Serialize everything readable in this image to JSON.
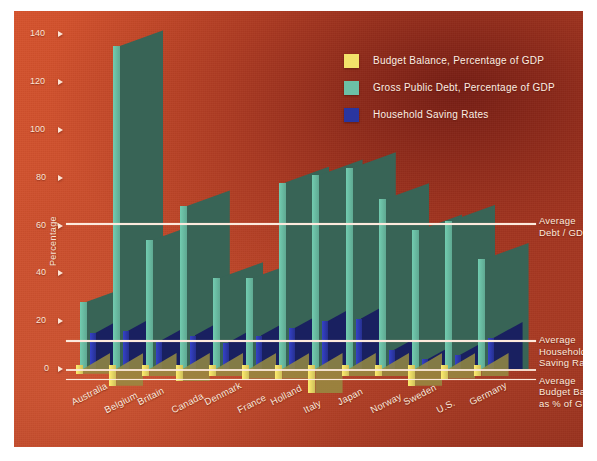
{
  "chart_data": {
    "type": "bar",
    "title": "",
    "subtitle": "",
    "xlabel": "",
    "ylabel": "Percentage",
    "ylim": [
      -10,
      140
    ],
    "yticks": [
      0,
      20,
      40,
      60,
      80,
      100,
      120,
      140
    ],
    "grid": false,
    "legend_position": "top-right",
    "categories": [
      "Australia",
      "Belgium",
      "Britain",
      "Canada",
      "Denmark",
      "France",
      "Holland",
      "Italy",
      "Japan",
      "Norway",
      "Sweden",
      "U.S.",
      "Germany"
    ],
    "series": [
      {
        "name": "Budget Balance, Percentage of GDP",
        "color": "#f2e26a",
        "values": [
          -2,
          -7,
          -3,
          -5,
          -3,
          -4,
          -4,
          -10,
          -3,
          -3,
          -7,
          -4,
          -3
        ]
      },
      {
        "name": "Gross Public Debt, Percentage of GDP",
        "color": "#6cc0a6",
        "values": [
          28,
          135,
          54,
          68,
          38,
          38,
          78,
          81,
          84,
          71,
          58,
          62,
          46
        ]
      },
      {
        "name": "Household Saving Rates",
        "color": "#2a35a0",
        "values": [
          15,
          16,
          12,
          14,
          11,
          14,
          17,
          20,
          21,
          8,
          4,
          6,
          13
        ]
      }
    ],
    "reference_lines": [
      {
        "label": "Average\nDebt / GDP",
        "label_lines": [
          "Average",
          "Debt / GDP"
        ],
        "value": 61
      },
      {
        "label": "Average\nHousehold\nSaving Rate",
        "label_lines": [
          "Average",
          "Household",
          "Saving Rate"
        ],
        "value": 12
      },
      {
        "label": "Average\nBudget Balance\nas % of GDP",
        "label_lines": [
          "Average",
          "Budget Balance",
          "as % of GDP"
        ],
        "value": -4
      }
    ]
  },
  "legend": {
    "items": [
      {
        "label": "Budget Balance, Percentage of GDP",
        "color": "#f2e26a"
      },
      {
        "label": "Gross Public Debt, Percentage of GDP",
        "color": "#6cc0a6"
      },
      {
        "label": "Household Saving Rates",
        "color": "#2a35a0"
      }
    ]
  },
  "axis": {
    "y_title": "Percentage",
    "y_ticks": [
      "140",
      "120",
      "100",
      "80",
      "60",
      "40",
      "20",
      "0"
    ]
  },
  "colors": {
    "budget_balance": "#f2e26a",
    "public_debt": "#6cc0a6",
    "saving_rate": "#2a35a0",
    "background_light": "#d9552e",
    "background_dark": "#8f2f1d",
    "text": "#fdeadd"
  }
}
